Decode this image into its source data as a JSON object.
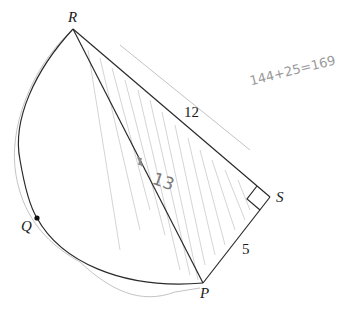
{
  "figure": {
    "points": {
      "R": "R",
      "S": "S",
      "P": "P",
      "Q": "Q"
    },
    "lengths": {
      "RS": "12",
      "SP": "5"
    },
    "handwritten": {
      "diameter_label": "13",
      "equation": "144+25=169"
    },
    "colors": {
      "ink": "#2a2a2a",
      "pencil": "#c4c4c4",
      "shading": "#cfcfcf"
    }
  }
}
